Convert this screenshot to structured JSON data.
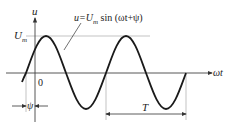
{
  "diagram": {
    "labels": {
      "y_axis": "u",
      "x_axis": "ωt",
      "amplitude": "U",
      "amplitude_sub": "m",
      "origin": "0",
      "phase": "ψ",
      "period": "T",
      "equation_lhs": "u=U",
      "equation_sub": "m",
      "equation_rhs": " sin (ωt+ψ)"
    },
    "colors": {
      "curve": "#1a1a1a",
      "axes": "#333333",
      "guides": "#999999"
    }
  }
}
